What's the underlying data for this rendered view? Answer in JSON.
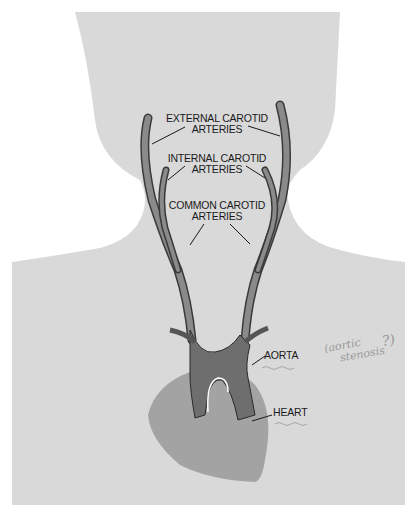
{
  "diagram": {
    "labels": {
      "external_carotid": [
        "EXTERNAL CAROTID",
        "ARTERIES"
      ],
      "internal_carotid": [
        "INTERNAL CAROTID",
        "ARTERIES"
      ],
      "common_carotid": [
        "COMMON CAROTID",
        "ARTERIES"
      ],
      "aorta": "AORTA",
      "heart": "HEART"
    },
    "annotation": {
      "line1": "(aortic",
      "line2": "stenosis",
      "question": "?)"
    },
    "colors": {
      "body": "#d9d9d9",
      "artery": "#7a7a7a",
      "artery_outline": "#3a3a3a",
      "aorta": "#6e6e6e",
      "heart": "#a3a3a3",
      "text": "#1a1a1a",
      "handwriting": "#9a9a9a"
    }
  }
}
